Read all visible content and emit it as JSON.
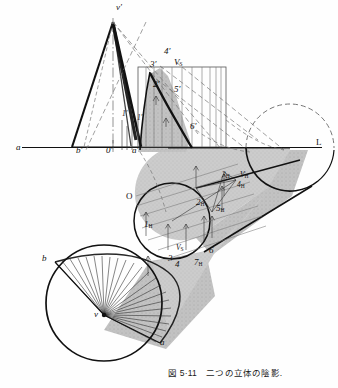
{
  "figure": {
    "caption": "図 5·11　二つの立体の陰影.",
    "title": "二つの立体の陰影",
    "number": "5·11",
    "kind": "descriptive-geometry shadow construction of a cone and a cylinder"
  },
  "colors": {
    "ink": "#111111",
    "paper": "#fefefe",
    "shade_fill": "#c9c9c9",
    "shade_fill_light": "#d8d8d8",
    "thin_rule": "#555555",
    "dash": "#666666"
  },
  "labels": [
    {
      "id": "v-prime",
      "text": "v",
      "prime": "′",
      "sub": "",
      "x": 116,
      "y": 6,
      "note": "cone apex, front view"
    },
    {
      "id": "a-left",
      "text": "a",
      "prime": "",
      "sub": "",
      "x": 16,
      "y": 148,
      "note": "ground line left end"
    },
    {
      "id": "b-prime",
      "text": "b",
      "prime": "′",
      "sub": "",
      "x": 76,
      "y": 150,
      "note": "cone base left, front view"
    },
    {
      "id": "o-prime",
      "text": "0",
      "prime": "′",
      "sub": "",
      "x": 108,
      "y": 150,
      "note": "origin, front view"
    },
    {
      "id": "one-prime",
      "text": "1",
      "prime": "′",
      "sub": "",
      "x": 123,
      "y": 150,
      "note": "point 1 front view"
    },
    {
      "id": "a-prime",
      "text": "a",
      "prime": "′",
      "sub": "",
      "x": 134,
      "y": 150,
      "note": "cone base right, front view"
    },
    {
      "id": "L",
      "text": "L",
      "prime": "",
      "sub": "",
      "x": 318,
      "y": 142,
      "note": "ground line right end"
    },
    {
      "id": "three-prime",
      "text": "3",
      "prime": "′",
      "sub": "",
      "x": 152,
      "y": 63,
      "note": "point 3 front view"
    },
    {
      "id": "four-prime",
      "text": "4",
      "prime": "′",
      "sub": "",
      "x": 166,
      "y": 50,
      "note": "point 4 front view"
    },
    {
      "id": "vs-front",
      "text": "V",
      "prime": "",
      "sub": "S",
      "x": 176,
      "y": 62,
      "note": "light source front view"
    },
    {
      "id": "two-prime",
      "text": "2",
      "prime": "′",
      "sub": "",
      "x": 155,
      "y": 83,
      "note": "point 2 front view"
    },
    {
      "id": "five-prime",
      "text": "5",
      "prime": "′",
      "sub": "",
      "x": 176,
      "y": 88,
      "note": "point 5 front view"
    },
    {
      "id": "six-prime",
      "text": "6",
      "prime": "′",
      "sub": "",
      "x": 192,
      "y": 126,
      "note": "point 6 front view"
    },
    {
      "id": "one-prime-b",
      "text": "1",
      "prime": "′",
      "sub": "",
      "x": 139,
      "y": 118,
      "note": "point 1 front view inner"
    },
    {
      "id": "O-plan",
      "text": "O",
      "prime": "",
      "sub": "",
      "x": 128,
      "y": 196,
      "note": "cylinder axis end, plan"
    },
    {
      "id": "one-H",
      "text": "1",
      "prime": "",
      "sub": "H",
      "x": 146,
      "y": 224,
      "note": "point 1 plan"
    },
    {
      "id": "two-H",
      "text": "2",
      "prime": "",
      "sub": "H",
      "x": 198,
      "y": 202,
      "note": "point 2 plan"
    },
    {
      "id": "three-H",
      "text": "3",
      "prime": "",
      "sub": "H",
      "x": 224,
      "y": 175,
      "note": "point 3 plan"
    },
    {
      "id": "vh-plan",
      "text": "V",
      "prime": "",
      "sub": "H",
      "x": 242,
      "y": 175,
      "note": "light source plan"
    },
    {
      "id": "four-H",
      "text": "4",
      "prime": "",
      "sub": "H",
      "x": 239,
      "y": 185,
      "note": "point 4 plan"
    },
    {
      "id": "five-H",
      "text": "5",
      "prime": "",
      "sub": "H",
      "x": 218,
      "y": 208,
      "note": "point 5 plan"
    },
    {
      "id": "vs-plan",
      "text": "V",
      "prime": "",
      "sub": "S",
      "x": 178,
      "y": 248,
      "note": "light source plan, cone"
    },
    {
      "id": "three-pl",
      "text": "3",
      "prime": "",
      "sub": "",
      "x": 170,
      "y": 258,
      "note": "point 3 plan cone"
    },
    {
      "id": "four-pl",
      "text": "4",
      "prime": "",
      "sub": "",
      "x": 177,
      "y": 264,
      "note": "point 4 plan cone"
    },
    {
      "id": "six-pl",
      "text": "6",
      "prime": "",
      "sub": "",
      "x": 210,
      "y": 250,
      "note": "point 6 plan cone"
    },
    {
      "id": "seven-H",
      "text": "7",
      "prime": "",
      "sub": "H",
      "x": 196,
      "y": 262,
      "note": "point 7 plan"
    },
    {
      "id": "b-plan",
      "text": "b",
      "prime": "",
      "sub": "",
      "x": 42,
      "y": 258,
      "note": "cone base left, plan"
    },
    {
      "id": "v-plan",
      "text": "v",
      "prime": "",
      "sub": "",
      "x": 95,
      "y": 314,
      "note": "cone apex, plan"
    },
    {
      "id": "a-plan",
      "text": "a",
      "prime": "",
      "sub": "",
      "x": 161,
      "y": 342,
      "note": "cone base right, plan"
    }
  ]
}
